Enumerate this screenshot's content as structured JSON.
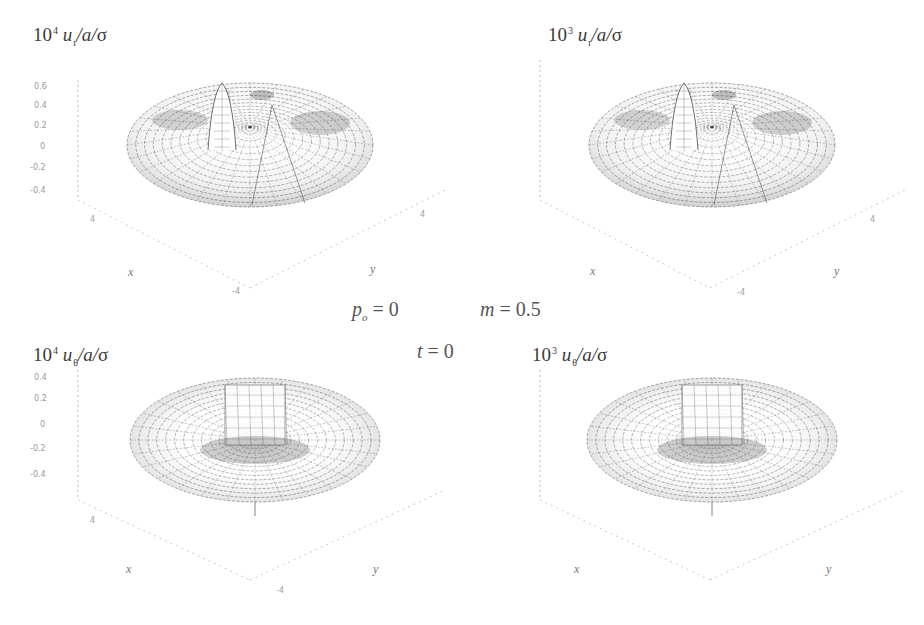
{
  "figure": {
    "parameters": {
      "p0": {
        "symbol": "p",
        "subscript": "o",
        "eq": "= ",
        "value": "0"
      },
      "m": {
        "symbol": "m",
        "eq": "= ",
        "value": "0.5"
      },
      "t": {
        "symbol": "t",
        "eq": "= ",
        "value": "0"
      }
    },
    "panels": [
      {
        "id": "top-left",
        "label": {
          "ten": "10",
          "power": "4",
          "var": "u",
          "sub": "r",
          "rest": "/a/",
          "sigma": "σ"
        },
        "z_ticks": [
          "0.6",
          "0.4",
          "0.2",
          "0",
          "-0.2",
          "-0.4"
        ],
        "x_axis": "x",
        "y_axis": "y",
        "x_ticks": [
          "4",
          "-4"
        ],
        "y_ticks": [
          "4",
          "-4"
        ],
        "surface": "peak-ridge"
      },
      {
        "id": "top-right",
        "label": {
          "ten": "10",
          "power": "3",
          "var": "u",
          "sub": "r",
          "rest": "/a/",
          "sigma": "σ"
        },
        "z_ticks": [],
        "x_axis": "x",
        "y_axis": "y",
        "x_ticks": [
          "4",
          "-4"
        ],
        "y_ticks": [
          "4",
          "-4"
        ],
        "surface": "peak-ridge"
      },
      {
        "id": "bottom-left",
        "label": {
          "ten": "10",
          "power": "4",
          "var": "u",
          "sub": "θ",
          "rest": "/a/",
          "sigma": "σ"
        },
        "z_ticks": [
          "0.4",
          "0.2",
          "0",
          "-0.2",
          "-0.4"
        ],
        "x_axis": "x",
        "y_axis": "y",
        "x_ticks": [
          "4",
          "-4"
        ],
        "y_ticks": [
          "4",
          "-4"
        ],
        "surface": "central-well"
      },
      {
        "id": "bottom-right",
        "label": {
          "ten": "10",
          "power": "3",
          "var": "u",
          "sub": "θ",
          "rest": "/a/",
          "sigma": "σ"
        },
        "z_ticks": [],
        "x_axis": "x",
        "y_axis": "y",
        "x_ticks": [
          "4",
          "-4"
        ],
        "y_ticks": [
          "4",
          "-4"
        ],
        "surface": "central-well"
      }
    ]
  }
}
